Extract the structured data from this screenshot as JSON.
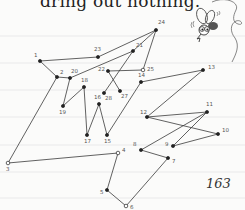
{
  "page": {
    "top_text": "dring out nothing.",
    "page_number": "163"
  },
  "colors": {
    "paper": "#fbfbfa",
    "rule_line": "#e6e6e6",
    "ink": "#3a3a3a",
    "text": "#222222"
  },
  "ruled_lines_y": [
    36,
    63,
    90,
    117,
    145,
    172,
    198
  ],
  "puzzle": {
    "title": "connect-the-dots",
    "dots": [
      {
        "n": "1",
        "x": 40,
        "y": 61,
        "lx": -6,
        "ly": -4
      },
      {
        "n": "2",
        "x": 57,
        "y": 77,
        "lx": 3,
        "ly": -3
      },
      {
        "n": "3",
        "x": 8,
        "y": 163,
        "lx": -2,
        "ly": 8
      },
      {
        "n": "4",
        "x": 118,
        "y": 153,
        "lx": 4,
        "ly": -1
      },
      {
        "n": "5",
        "x": 107,
        "y": 190,
        "lx": -7,
        "ly": 4
      },
      {
        "n": "6",
        "x": 126,
        "y": 206,
        "lx": 4,
        "ly": 3
      },
      {
        "n": "7",
        "x": 168,
        "y": 158,
        "lx": 4,
        "ly": 5
      },
      {
        "n": "8",
        "x": 141,
        "y": 150,
        "lx": -8,
        "ly": -4
      },
      {
        "n": "9",
        "x": 173,
        "y": 146,
        "lx": -8,
        "ly": 0
      },
      {
        "n": "10",
        "x": 218,
        "y": 134,
        "lx": 4,
        "ly": -2
      },
      {
        "n": "11",
        "x": 207,
        "y": 112,
        "lx": -1,
        "ly": -6
      },
      {
        "n": "12",
        "x": 147,
        "y": 117,
        "lx": -7,
        "ly": -3
      },
      {
        "n": "13",
        "x": 203,
        "y": 70,
        "lx": 5,
        "ly": -1
      },
      {
        "n": "14",
        "x": 141,
        "y": 82,
        "lx": -3,
        "ly": -5
      },
      {
        "n": "15",
        "x": 107,
        "y": 135,
        "lx": -3,
        "ly": 8
      },
      {
        "n": "16",
        "x": 99,
        "y": 104,
        "lx": -5,
        "ly": -5
      },
      {
        "n": "17",
        "x": 87,
        "y": 135,
        "lx": -3,
        "ly": 8
      },
      {
        "n": "18",
        "x": 84,
        "y": 87,
        "lx": -3,
        "ly": -5
      },
      {
        "n": "19",
        "x": 63,
        "y": 106,
        "lx": -4,
        "ly": 8
      },
      {
        "n": "20",
        "x": 70,
        "y": 78,
        "lx": 1,
        "ly": -5
      },
      {
        "n": "21",
        "x": 133,
        "y": 51,
        "lx": 3,
        "ly": -4
      },
      {
        "n": "22",
        "x": 108,
        "y": 71,
        "lx": -10,
        "ly": 0
      },
      {
        "n": "23",
        "x": 98,
        "y": 57,
        "lx": -4,
        "ly": -6
      },
      {
        "n": "24",
        "x": 156,
        "y": 30,
        "lx": 2,
        "ly": -6
      },
      {
        "n": "25",
        "x": 143,
        "y": 70,
        "lx": 4,
        "ly": 1
      },
      {
        "n": "27",
        "x": 120,
        "y": 91,
        "lx": 1,
        "ly": 7
      },
      {
        "n": "28",
        "x": 104,
        "y": 93,
        "lx": 1,
        "ly": 7
      }
    ],
    "path_order": [
      "1",
      "2",
      "3",
      "4",
      "5",
      "6",
      "7",
      "8",
      "11",
      "12",
      "13",
      "14",
      "15",
      "16",
      "17",
      "18",
      "19",
      "20",
      "21",
      "24",
      "23",
      "1"
    ],
    "extra_segments": [
      [
        "2",
        "20"
      ],
      [
        "21",
        "28"
      ],
      [
        "22",
        "25"
      ],
      [
        "22",
        "27"
      ],
      [
        "24",
        "25"
      ],
      [
        "9",
        "10"
      ],
      [
        "10",
        "12"
      ],
      [
        "9",
        "11"
      ]
    ]
  },
  "illustration": {
    "name": "cartoon-fly",
    "marks_left": "((",
    "marks_right": "))"
  }
}
